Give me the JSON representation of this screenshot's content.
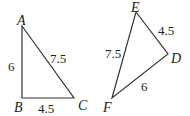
{
  "diagram": {
    "triangle1": {
      "vertices": {
        "A": "A",
        "B": "B",
        "C": "C"
      },
      "sides": {
        "AB": "6",
        "BC": "4.5",
        "AC": "7.5"
      }
    },
    "triangle2": {
      "vertices": {
        "E": "E",
        "D": "D",
        "F": "F"
      },
      "sides": {
        "ED": "4.5",
        "DF": "6",
        "EF": "7.5"
      }
    }
  }
}
